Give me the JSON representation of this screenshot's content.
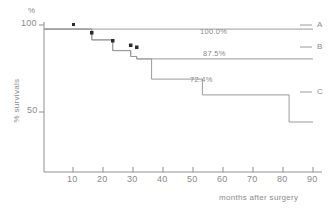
{
  "chart_data": {
    "type": "line",
    "title": "",
    "subtitle": "",
    "xlabel": "months after surgery",
    "ylabel": "% survivals",
    "yunit": "%",
    "xlim": [
      0,
      90
    ],
    "ylim": [
      40,
      103
    ],
    "xticks": [
      10,
      20,
      30,
      40,
      50,
      60,
      70,
      80,
      90
    ],
    "yticks": [
      50,
      100
    ],
    "grid": false,
    "legend_position": "right-inline",
    "series": [
      {
        "name": "A",
        "label": "A",
        "final_value_label": "100.0%",
        "final_value": 100.0,
        "points": [
          [
            0,
            100
          ],
          [
            90,
            100
          ]
        ],
        "censor_marks": [
          [
            10,
            100
          ]
        ]
      },
      {
        "name": "B",
        "label": "B",
        "final_value_label": "87.5%",
        "final_value": 87.5,
        "points": [
          [
            0,
            100
          ],
          [
            16,
            100
          ],
          [
            16,
            95.5
          ],
          [
            23,
            95.5
          ],
          [
            23,
            91
          ],
          [
            29,
            91
          ],
          [
            29,
            88.5
          ],
          [
            31,
            88.5
          ],
          [
            31,
            87.5
          ],
          [
            90,
            87.5
          ]
        ],
        "censor_marks": [
          [
            16,
            95.5
          ],
          [
            23,
            91
          ],
          [
            29,
            88.5
          ],
          [
            31,
            87.5
          ]
        ]
      },
      {
        "name": "C",
        "label": "C",
        "final_value_label": "72.4%",
        "final_value": 72.4,
        "points": [
          [
            0,
            100
          ],
          [
            16,
            100
          ],
          [
            16,
            95.5
          ],
          [
            23,
            95.5
          ],
          [
            23,
            91
          ],
          [
            29,
            91
          ],
          [
            29,
            88.5
          ],
          [
            31,
            88.5
          ],
          [
            31,
            87.5
          ],
          [
            36,
            87.5
          ],
          [
            36,
            79
          ],
          [
            53,
            79
          ],
          [
            53,
            72.4
          ],
          [
            82,
            72.4
          ],
          [
            82,
            61
          ],
          [
            90,
            61
          ]
        ],
        "censor_marks": []
      }
    ],
    "annotations": [
      {
        "text": "100.0%",
        "x": 53,
        "y": 97.5,
        "series": "A"
      },
      {
        "text": "87.5%",
        "x": 53,
        "y": 84.5,
        "series": "B"
      },
      {
        "text": "72.4%",
        "x": 47,
        "y": 69.5,
        "series": "C"
      }
    ]
  },
  "figure": {
    "unit_label": "%",
    "y_axis_title": "% survivals",
    "x_axis_title": "months after surgery",
    "y_tick_100": "100",
    "y_tick_50": "50",
    "x_tick_10": "10",
    "x_tick_20": "20",
    "x_tick_30": "30",
    "x_tick_40": "40",
    "x_tick_50": "50",
    "x_tick_60": "60",
    "x_tick_70": "70",
    "x_tick_80": "80",
    "x_tick_90": "90",
    "label_a": "A",
    "label_b": "B",
    "label_c": "C",
    "pct_a": "100.0%",
    "pct_b": "87.5%",
    "pct_c": "72.4%",
    "line_color": "#9a9a9a",
    "axis_color": "#8f8f8f",
    "text_color": "#8a8a8a",
    "censor_color": "#2b2b2b",
    "background": "#ffffff"
  }
}
